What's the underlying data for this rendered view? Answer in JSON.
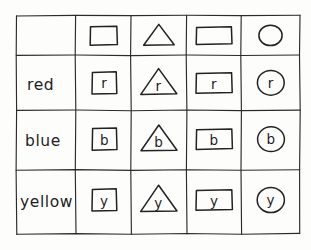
{
  "figure": {
    "kind": "hand-drawn-table",
    "background_color": "#fdfdfc",
    "ink_color": "#222222"
  },
  "table": {
    "corner_label": "",
    "column_headers": [
      {
        "shape": "square",
        "icon": "square-icon"
      },
      {
        "shape": "triangle",
        "icon": "triangle-icon"
      },
      {
        "shape": "rectangle",
        "icon": "rectangle-icon"
      },
      {
        "shape": "circle",
        "icon": "circle-icon"
      }
    ],
    "rows": [
      {
        "label": "red",
        "letter": "r",
        "cells": [
          {
            "shape": "square",
            "letter": "r"
          },
          {
            "shape": "triangle",
            "letter": "r"
          },
          {
            "shape": "rectangle",
            "letter": "r"
          },
          {
            "shape": "circle",
            "letter": "r"
          }
        ]
      },
      {
        "label": "blue",
        "letter": "b",
        "cells": [
          {
            "shape": "square",
            "letter": "b"
          },
          {
            "shape": "triangle",
            "letter": "b"
          },
          {
            "shape": "rectangle",
            "letter": "b"
          },
          {
            "shape": "circle",
            "letter": "b"
          }
        ]
      },
      {
        "label": "yellow",
        "letter": "y",
        "cells": [
          {
            "shape": "square",
            "letter": "y"
          },
          {
            "shape": "triangle",
            "letter": "y"
          },
          {
            "shape": "rectangle",
            "letter": "y"
          },
          {
            "shape": "circle",
            "letter": "y"
          }
        ]
      }
    ]
  }
}
